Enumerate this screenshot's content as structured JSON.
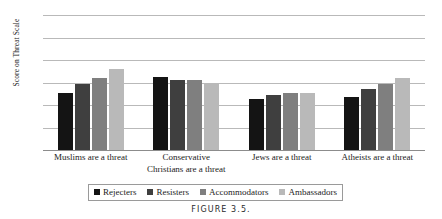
{
  "caption": "FIGURE 3.5.",
  "chart_data": {
    "type": "bar",
    "title": "",
    "subtitle": "",
    "xlabel": "",
    "ylabel": "Score on Threat Scale",
    "ylim": [
      0,
      12
    ],
    "yticks": [
      0,
      2,
      4,
      6,
      8,
      10,
      12
    ],
    "ytick_labels": [
      "0",
      "2",
      "4",
      "6",
      "8",
      "10",
      "12"
    ],
    "grid": true,
    "legend_position": "bottom",
    "categories": [
      "Muslims are a threat",
      "Conservative Christians are a threat",
      "Jews  are a threat",
      "Atheists  are a threat"
    ],
    "category_lines": [
      [
        "Muslims are a threat",
        ""
      ],
      [
        "Conservative",
        "Christians  are a threat"
      ],
      [
        "Jews  are a threat",
        ""
      ],
      [
        "Atheists  are a threat",
        ""
      ]
    ],
    "series": [
      {
        "name": "Rejecters",
        "color": "#141414",
        "values": [
          5.1,
          6.5,
          4.5,
          4.7
        ]
      },
      {
        "name": "Resisters",
        "color": "#3f3f3f",
        "values": [
          5.9,
          6.2,
          4.9,
          5.4
        ]
      },
      {
        "name": "Accommodators",
        "color": "#7f7f7f",
        "values": [
          6.4,
          6.2,
          5.1,
          5.9
        ]
      },
      {
        "name": "Ambassadors",
        "color": "#b9b9b9",
        "values": [
          7.2,
          5.9,
          5.1,
          6.4
        ]
      }
    ]
  }
}
